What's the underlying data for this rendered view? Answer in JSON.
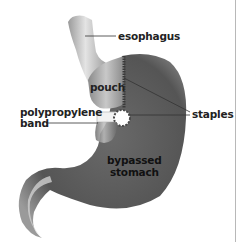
{
  "diagram": {
    "labels": {
      "esophagus": "esophagus",
      "pouch": "pouch",
      "staples": "staples",
      "band_line1": "polypropylene",
      "band_line2": "band",
      "bypassed_line1": "bypassed",
      "bypassed_line2": "stomach"
    },
    "colors": {
      "background": "#ffffff",
      "tissue_dark": "#5a5a5a",
      "tissue_mid": "#8a8a8a",
      "tissue_light": "#d0d0d0",
      "staple_line": "#3a3a3a",
      "leader_line": "#333333",
      "frame_line": "#b8b8b8"
    }
  }
}
